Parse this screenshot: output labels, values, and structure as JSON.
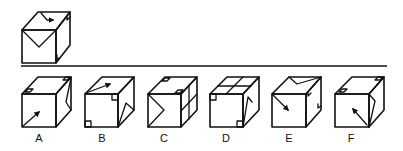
{
  "question": {
    "label": "Reference cube (folded view)",
    "front_pattern": "v-shape-from-top-corners",
    "top_pattern": "arrow-pointing-down-right",
    "right_pattern": "small-corner-squares"
  },
  "divider": {
    "color": "#111111"
  },
  "options": [
    {
      "id": "A",
      "label": "A"
    },
    {
      "id": "B",
      "label": "B"
    },
    {
      "id": "C",
      "label": "C"
    },
    {
      "id": "D",
      "label": "D"
    },
    {
      "id": "E",
      "label": "E"
    },
    {
      "id": "F",
      "label": "F"
    }
  ],
  "colors": {
    "ink": "#111111",
    "background": "#ffffff"
  }
}
